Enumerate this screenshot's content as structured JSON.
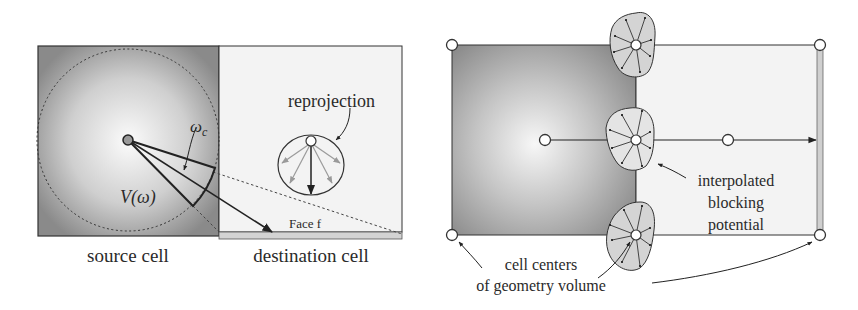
{
  "left_panel": {
    "source_cell_label": "source cell",
    "destination_cell_label": "destination cell",
    "reprojection_label": "reprojection",
    "face_label": "Face f",
    "omega_c_label": "ω",
    "omega_c_subscript": "c",
    "visibility_label": "V(ω)"
  },
  "right_panel": {
    "interpolated_label_line1": "interpolated",
    "interpolated_label_line2": "blocking",
    "interpolated_label_line3": "potential",
    "cell_centers_label_line1": "cell centers",
    "cell_centers_label_line2": "of geometry volume"
  },
  "colors": {
    "source_fill_dark": "#8e8e8e",
    "source_fill_light": "#f4f4f4",
    "destination_fill": "#f3f3f3",
    "stroke": "#333333",
    "face_strip": "#c8c8c8",
    "blob_fill": "#d6d6d6"
  }
}
